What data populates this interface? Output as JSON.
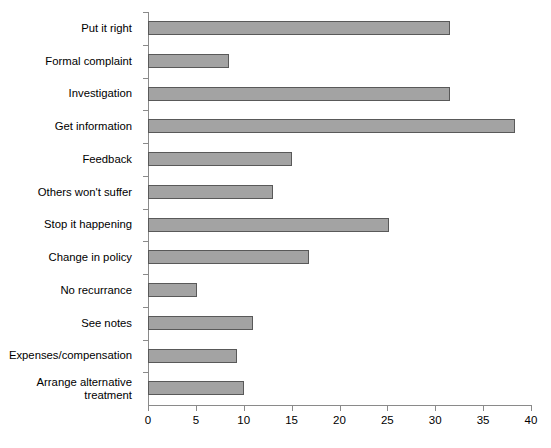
{
  "chart_data": {
    "type": "bar",
    "orientation": "horizontal",
    "title": "",
    "xlabel": "",
    "ylabel": "",
    "xlim": [
      0,
      40
    ],
    "ylim": null,
    "grid": false,
    "legend": null,
    "xticks": [
      0,
      5,
      10,
      15,
      20,
      25,
      30,
      35,
      40
    ],
    "xtick_labels": [
      "0",
      "5",
      "10",
      "15",
      "20",
      "25",
      "30",
      "35",
      "40"
    ],
    "categories": [
      "Put it right",
      "Formal complaint",
      "Investigation",
      "Get information",
      "Feedback",
      "Others won't suffer",
      "Stop it happening",
      "Change in policy",
      "No recurrance",
      "See notes",
      "Expenses/compensation",
      "Arrange alternative\ntreatment"
    ],
    "values": [
      31.5,
      8.5,
      31.5,
      38.3,
      15.0,
      13.1,
      25.2,
      16.8,
      5.1,
      11.0,
      9.3,
      10.0
    ],
    "bar_color": "#a3a3a3",
    "bar_edge_color": "#595959",
    "axis_color": "#8a8a8a",
    "background": "#ffffff"
  }
}
